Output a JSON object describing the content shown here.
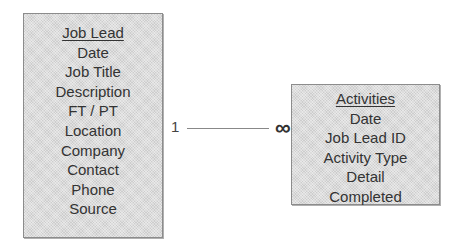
{
  "entities": {
    "job_lead": {
      "title": "Job Lead",
      "fields": [
        "Date",
        "Job Title",
        "Description",
        "FT / PT",
        "Location",
        "Company",
        "Contact",
        "Phone",
        "Source"
      ]
    },
    "activities": {
      "title": "Activities",
      "fields": [
        "Date",
        "Job Lead ID",
        "Activity Type",
        "Detail",
        "Completed"
      ]
    }
  },
  "relationship": {
    "from": "Job Lead",
    "to": "Activities",
    "from_cardinality": "1",
    "to_cardinality": "∞"
  }
}
